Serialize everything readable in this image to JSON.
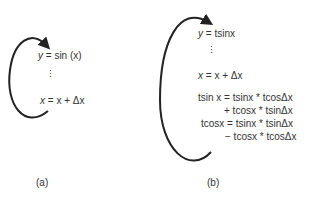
{
  "panel_a": {
    "label": "(a)",
    "line1_var": "y",
    "line1_rest": " = sin (x)",
    "dots": "⋮",
    "line2_var": "x",
    "line2_rest": " = x + Δx"
  },
  "panel_b": {
    "label": "(b)",
    "line1_var": "y",
    "line1_rest": " = tsinx",
    "dots": "⋮",
    "line2_var": "x",
    "line2_rest": " = x + Δx",
    "eq1a": "tsin x = tsinx * tcosΔx",
    "eq1b": "+ tcosx * tsinΔx",
    "eq2a": "tcosx = tsinx * tsinΔx",
    "eq2b": "− tcosx * tcosΔx"
  }
}
